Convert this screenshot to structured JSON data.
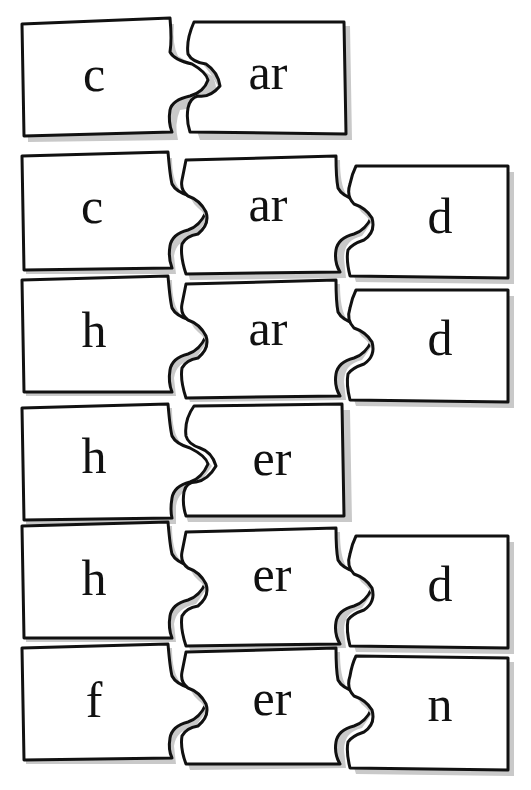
{
  "colors": {
    "background": "#ffffff",
    "outline": "#111111",
    "shadow": "#c9c9c9",
    "text": "#111111"
  },
  "rows": [
    {
      "word": "car",
      "pieces": [
        {
          "text": "c"
        },
        {
          "text": "ar"
        }
      ]
    },
    {
      "word": "card",
      "pieces": [
        {
          "text": "c"
        },
        {
          "text": "ar"
        },
        {
          "text": "d"
        }
      ]
    },
    {
      "word": "hard",
      "pieces": [
        {
          "text": "h"
        },
        {
          "text": "ar"
        },
        {
          "text": "d"
        }
      ]
    },
    {
      "word": "her",
      "pieces": [
        {
          "text": "h"
        },
        {
          "text": "er"
        }
      ]
    },
    {
      "word": "herd",
      "pieces": [
        {
          "text": "h"
        },
        {
          "text": "er"
        },
        {
          "text": "d"
        }
      ]
    },
    {
      "word": "fern",
      "pieces": [
        {
          "text": "f"
        },
        {
          "text": "er"
        },
        {
          "text": "n"
        }
      ]
    }
  ]
}
